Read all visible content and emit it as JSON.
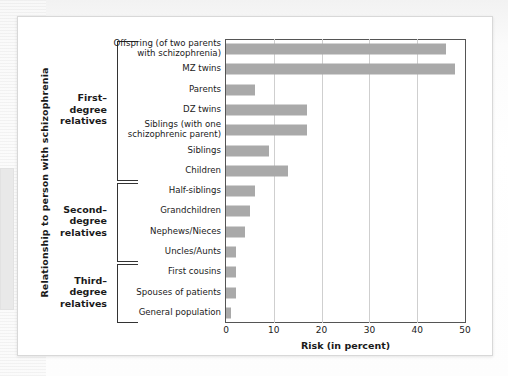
{
  "chart_data": {
    "type": "bar",
    "orientation": "horizontal",
    "title": "",
    "xlabel": "Risk (in percent)",
    "ylabel": "Relationship to person with schizophrenia",
    "xlim": [
      0,
      50
    ],
    "xticks": [
      0,
      10,
      20,
      30,
      40,
      50
    ],
    "grid": true,
    "legend": "none",
    "bar_color": "#a9a9a9",
    "categories": [
      "Offspring (of two parents with schizophrenia)",
      "MZ twins",
      "Parents",
      "DZ twins",
      "Siblings (with one schizophrenic parent)",
      "Siblings",
      "Children",
      "Half-siblings",
      "Grandchildren",
      "Nephews/Nieces",
      "Uncles/Aunts",
      "First cousins",
      "Spouses  of patients",
      "General population"
    ],
    "values": [
      46,
      48,
      6,
      17,
      17,
      9,
      13,
      6,
      5,
      4,
      2,
      2,
      2,
      1
    ],
    "groups": [
      {
        "label": "First–\ndegree\nrelatives",
        "start_index": 0,
        "end_index": 6
      },
      {
        "label": "Second–\ndegree\nrelatives",
        "start_index": 7,
        "end_index": 10
      },
      {
        "label": "Third–\ndegree\nrelatives",
        "start_index": 11,
        "end_index": 13
      }
    ]
  },
  "labels": {
    "cat_0_line1": "Offspring (of two parents",
    "cat_0_line2": "with schizophrenia)",
    "cat_4_line1": "Siblings (with one",
    "cat_4_line2": "schizophrenic parent)",
    "group_0_l1": "First–",
    "group_0_l2": "degree",
    "group_0_l3": "relatives",
    "group_1_l1": "Second–",
    "group_1_l2": "degree",
    "group_1_l3": "relatives",
    "group_2_l1": "Third–",
    "group_2_l2": "degree",
    "group_2_l3": "relatives"
  }
}
